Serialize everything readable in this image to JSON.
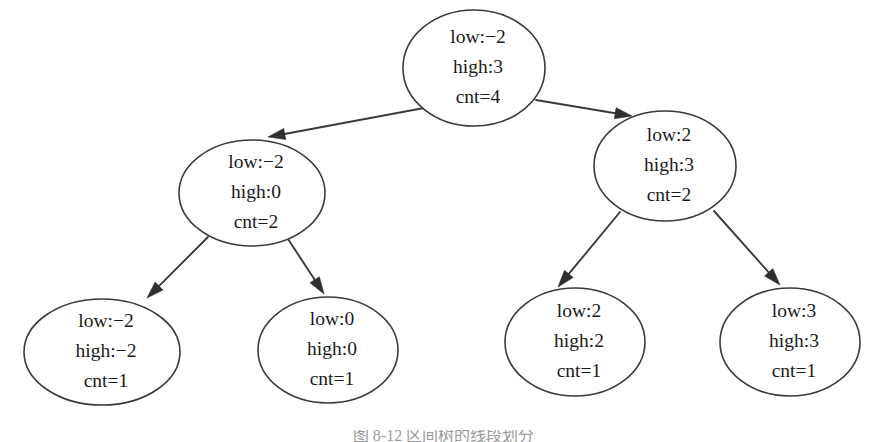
{
  "figure": {
    "kind": "binary-tree-diagram",
    "background_color": "#ffffff",
    "node_stroke_color": "#3a3a3a",
    "edge_color": "#3a3a3a",
    "text_color": "#1a1a1a",
    "caption": "图 8-12  区间树的线段划分",
    "caption_color": "#9a9a9a"
  },
  "tree": {
    "nodes": [
      {
        "id": "root",
        "label_low": "low:−2",
        "label_high": "high:3",
        "label_cnt": "cnt=4",
        "cx": 474,
        "cy": 68,
        "rx": 71,
        "ry": 58
      },
      {
        "id": "left-mid",
        "label_low": "low:−2",
        "label_high": "high:0",
        "label_cnt": "cnt=2",
        "cx": 252,
        "cy": 193,
        "rx": 73,
        "ry": 53
      },
      {
        "id": "right-mid",
        "label_low": "low:2",
        "label_high": "high:3",
        "label_cnt": "cnt=2",
        "cx": 665,
        "cy": 166,
        "rx": 71,
        "ry": 55
      },
      {
        "id": "leaf-1",
        "label_low": "low:−2",
        "label_high": "high:−2",
        "label_cnt": "cnt=1",
        "cx": 102,
        "cy": 352,
        "rx": 78,
        "ry": 53
      },
      {
        "id": "leaf-2",
        "label_low": "low:0",
        "label_high": "high:0",
        "label_cnt": "cnt=1",
        "cx": 328,
        "cy": 350,
        "rx": 70,
        "ry": 53
      },
      {
        "id": "leaf-3",
        "label_low": "low:2",
        "label_high": "high:2",
        "label_cnt": "cnt=1",
        "cx": 575,
        "cy": 342,
        "rx": 70,
        "ry": 54
      },
      {
        "id": "leaf-4",
        "label_low": "low:3",
        "label_high": "high:3",
        "label_cnt": "cnt=1",
        "cx": 790,
        "cy": 342,
        "rx": 70,
        "ry": 54
      }
    ],
    "edges": [
      {
        "from": "root",
        "to": "left-mid",
        "x1": 424,
        "y1": 108,
        "x2": 268,
        "y2": 137
      },
      {
        "from": "root",
        "to": "right-mid",
        "x1": 536,
        "y1": 100,
        "x2": 632,
        "y2": 116
      },
      {
        "from": "left-mid",
        "to": "leaf-1",
        "x1": 208,
        "y1": 237,
        "x2": 147,
        "y2": 298
      },
      {
        "from": "left-mid",
        "to": "leaf-2",
        "x1": 288,
        "y1": 239,
        "x2": 324,
        "y2": 294
      },
      {
        "from": "right-mid",
        "to": "leaf-3",
        "x1": 620,
        "y1": 212,
        "x2": 558,
        "y2": 287
      },
      {
        "from": "right-mid",
        "to": "leaf-4",
        "x1": 714,
        "y1": 211,
        "x2": 780,
        "y2": 285
      }
    ]
  }
}
